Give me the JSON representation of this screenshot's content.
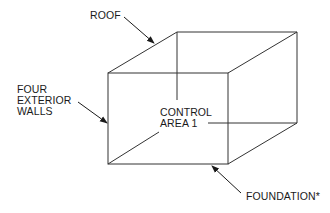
{
  "diagram": {
    "type": "isometric-box",
    "labels": {
      "roof": "ROOF",
      "walls_line1": "FOUR",
      "walls_line2": "EXTERIOR",
      "walls_line3": "WALLS",
      "control_line1": "CONTROL",
      "control_line2": "AREA 1",
      "foundation": "FOUNDATION*"
    },
    "colors": {
      "line": "#333333",
      "text": "#1a1a1a",
      "background": "#ffffff"
    }
  }
}
